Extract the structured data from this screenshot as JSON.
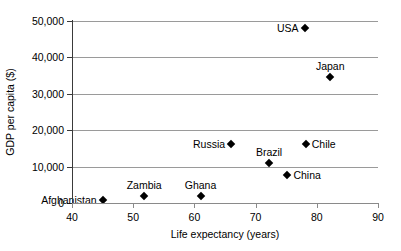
{
  "chart_data": {
    "type": "scatter",
    "title": "",
    "xlabel": "Life expectancy (years)",
    "ylabel": "GDP per capita ($)",
    "xlim": [
      40,
      90
    ],
    "ylim": [
      0,
      50000
    ],
    "xticks": [
      "40",
      "50",
      "60",
      "70",
      "80",
      "90"
    ],
    "xtick_values": [
      40,
      50,
      60,
      70,
      80,
      90
    ],
    "yticks": [
      "0",
      "10,000",
      "20,000",
      "30,000",
      "40,000",
      "50,000"
    ],
    "ytick_values": [
      0,
      10000,
      20000,
      30000,
      40000,
      50000
    ],
    "grid": "horizontal",
    "legend": "none",
    "marker": "diamond",
    "marker_color": "#000000",
    "gridline_color": "#9a9a9a",
    "points": [
      {
        "label": "Afghanistan",
        "x": 45.0,
        "y": 800,
        "label_pos": "left"
      },
      {
        "label": "Zambia",
        "x": 51.8,
        "y": 1800,
        "label_pos": "above"
      },
      {
        "label": "Ghana",
        "x": 61.0,
        "y": 1800,
        "label_pos": "above"
      },
      {
        "label": "Russia",
        "x": 66.0,
        "y": 16200,
        "label_pos": "left"
      },
      {
        "label": "Brazil",
        "x": 72.2,
        "y": 11000,
        "label_pos": "above"
      },
      {
        "label": "China",
        "x": 75.2,
        "y": 7800,
        "label_pos": "right"
      },
      {
        "label": "Chile",
        "x": 78.2,
        "y": 16100,
        "label_pos": "right"
      },
      {
        "label": "USA",
        "x": 78.0,
        "y": 48000,
        "label_pos": "left"
      },
      {
        "label": "Japan",
        "x": 82.2,
        "y": 34600,
        "label_pos": "above"
      }
    ]
  }
}
